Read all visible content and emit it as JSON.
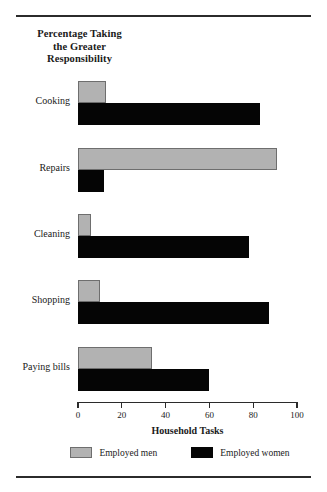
{
  "chart_data": {
    "type": "bar",
    "orientation": "horizontal",
    "title": "Percentage Taking the Greater Responsibility",
    "title_lines": [
      "Percentage Taking",
      "the Greater",
      "Responsibility"
    ],
    "xlabel": "Household Tasks",
    "ylabel": "",
    "xlim": [
      0,
      100
    ],
    "xticks": [
      0,
      20,
      40,
      60,
      80,
      100
    ],
    "xtick_labels": [
      "0",
      "20",
      "40",
      "60",
      "80",
      "100"
    ],
    "grid": false,
    "legend_position": "bottom",
    "categories": [
      "Cooking",
      "Repairs",
      "Cleaning",
      "Shopping",
      "Paying bills"
    ],
    "series": [
      {
        "name": "Employed men",
        "color": "#b2b2b2",
        "values": [
          13,
          91,
          6,
          10,
          34
        ]
      },
      {
        "name": "Employed women",
        "color": "#050505",
        "values": [
          83,
          12,
          78,
          87,
          60
        ]
      }
    ]
  },
  "legend": {
    "items": [
      {
        "label": "Employed men",
        "swatch": "gray-swatch"
      },
      {
        "label": "Employed women",
        "swatch": "black-swatch"
      }
    ]
  },
  "colors": {
    "men": "#b2b2b2",
    "women": "#050505",
    "axis": "#2b2b2b",
    "background": "#ffffff"
  }
}
